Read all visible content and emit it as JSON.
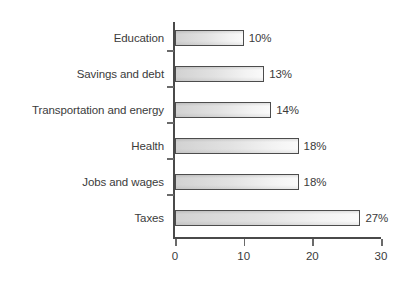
{
  "chart_data": {
    "type": "bar",
    "orientation": "horizontal",
    "title": "",
    "subtitle": "",
    "xlabel": "",
    "ylabel": "",
    "categories": [
      "Education",
      "Savings and debt",
      "Transportation and energy",
      "Health",
      "Jobs and wages",
      "Taxes"
    ],
    "values": [
      10,
      13,
      14,
      18,
      18,
      27
    ],
    "data_labels": [
      "10%",
      "13%",
      "14%",
      "18%",
      "18%",
      "27%"
    ],
    "xlim": [
      0,
      30
    ],
    "xticks": [
      0,
      10,
      20,
      30
    ],
    "xtick_labels": [
      "0",
      "10",
      "20",
      "30"
    ],
    "grid": false,
    "legend": null,
    "bar_fill_light": "#fafafa",
    "bar_fill_dark": "#d2d2d2",
    "bar_border_color": "#4c4c4c",
    "axis_color": "#4a4a4a",
    "text_color": "#3b3b3b",
    "background_color": "#ffffff"
  }
}
